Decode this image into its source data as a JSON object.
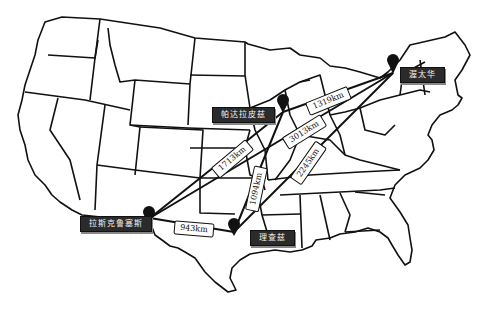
{
  "map": {
    "type": "route-map",
    "region": "United States (contiguous)",
    "background_color": "#ffffff",
    "line_color": "#111111",
    "label_bg_color": "#2b2b2b",
    "cities": [
      {
        "id": "ottawa",
        "label": "渥太华",
        "pin_x": 393,
        "pin_y": 73,
        "label_x": 400,
        "label_y": 67
      },
      {
        "id": "minneapolis",
        "label": "帕达拉皮兹",
        "pin_x": 283,
        "pin_y": 112,
        "label_x": 212,
        "label_y": 108
      },
      {
        "id": "las_cruces",
        "label": "拉斯克鲁塞斯",
        "pin_x": 150,
        "pin_y": 218,
        "label_x": 80,
        "label_y": 216
      },
      {
        "id": "lake_charles",
        "label": "理查兹",
        "pin_x": 234,
        "pin_y": 232,
        "label_x": 250,
        "label_y": 230
      }
    ],
    "routes": [
      {
        "from": "ottawa",
        "to": "minneapolis",
        "distance": "1319km",
        "label_x": 308,
        "label_y": 97,
        "angle": -22
      },
      {
        "from": "ottawa",
        "to": "las_cruces",
        "distance": "3013km",
        "label_x": 283,
        "label_y": 127,
        "angle": -30
      },
      {
        "from": "ottawa",
        "to": "lake_charles",
        "distance": "2245km",
        "label_x": 291,
        "label_y": 157,
        "angle": -55
      },
      {
        "from": "minneapolis",
        "to": "las_cruces",
        "distance": "1713km",
        "label_x": 214,
        "label_y": 154,
        "angle": -40
      },
      {
        "from": "minneapolis",
        "to": "lake_charles",
        "distance": "1094km",
        "label_x": 240,
        "label_y": 184,
        "angle": -78
      },
      {
        "from": "las_cruces",
        "to": "lake_charles",
        "distance": "943km",
        "label_x": 176,
        "label_y": 225,
        "angle": 4
      }
    ]
  }
}
